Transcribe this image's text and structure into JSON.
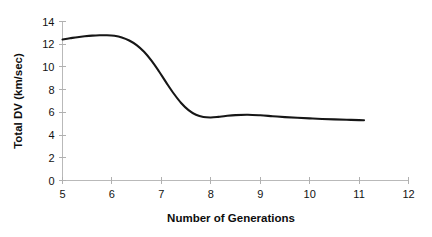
{
  "chart_data": {
    "type": "line",
    "title": "",
    "xlabel": "Number of Generations",
    "ylabel": "Total DV (km/sec)",
    "xlim": [
      5,
      12
    ],
    "ylim": [
      0,
      14
    ],
    "xticks": [
      5,
      6,
      7,
      8,
      9,
      10,
      11,
      12
    ],
    "xtick_labels": [
      "5",
      "6",
      "7",
      "8",
      "9",
      "10",
      "11",
      "12"
    ],
    "yticks": [
      0,
      2,
      4,
      6,
      8,
      10,
      12,
      14
    ],
    "ytick_labels": [
      "0",
      "2",
      "4",
      "6",
      "8",
      "10",
      "12",
      "14"
    ],
    "grid": false,
    "legend": false,
    "series": [
      {
        "name": "Total DV",
        "color": "#161616",
        "x": [
          5.0,
          5.15,
          5.3,
          5.45,
          5.6,
          5.75,
          5.9,
          6.05,
          6.2,
          6.35,
          6.5,
          6.65,
          6.8,
          6.95,
          7.1,
          7.25,
          7.4,
          7.55,
          7.7,
          7.85,
          8.0,
          8.15,
          8.3,
          8.5,
          8.75,
          9.0,
          9.25,
          9.5,
          9.75,
          10.0,
          10.25,
          10.5,
          10.75,
          11.0,
          11.1
        ],
        "y": [
          12.42,
          12.52,
          12.62,
          12.7,
          12.76,
          12.79,
          12.79,
          12.74,
          12.6,
          12.33,
          11.92,
          11.33,
          10.55,
          9.62,
          8.62,
          7.66,
          6.83,
          6.2,
          5.79,
          5.59,
          5.55,
          5.6,
          5.68,
          5.76,
          5.79,
          5.74,
          5.66,
          5.58,
          5.52,
          5.47,
          5.42,
          5.38,
          5.35,
          5.32,
          5.3
        ]
      }
    ],
    "annotations": []
  },
  "axes": {
    "y_title": "Total DV (km/sec)",
    "x_title": "Number of Generations"
  }
}
